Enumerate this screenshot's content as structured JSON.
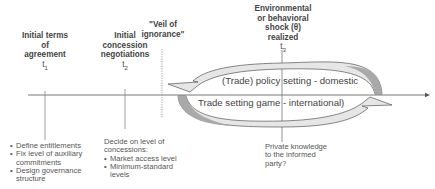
{
  "diagram": {
    "type": "timeline",
    "events": [
      {
        "id": "t1",
        "heading": [
          "Initial terms",
          "of",
          "agreement"
        ],
        "time_label": "t",
        "time_subscript": "1",
        "details": [
          "Define entitlements",
          "Fix level of auxiliary commitments",
          "Design governance structure"
        ]
      },
      {
        "id": "t2",
        "heading": [
          "Initial",
          "concession",
          "negotiations"
        ],
        "time_label": "t",
        "time_subscript": "2",
        "details_intro": "Decide on level of concessions:",
        "details": [
          "Market access level",
          "Minimum-standard levels"
        ]
      },
      {
        "id": "veil",
        "heading": [
          "\"Veil of",
          "ignorance\""
        ]
      },
      {
        "id": "t3",
        "heading": [
          "Environmental",
          "or behavioral",
          "shock (θ)",
          "realized"
        ],
        "time_label": "t",
        "time_subscript": "3",
        "details_intro": "Private knowledge to the informed party?"
      }
    ],
    "loop": {
      "top_label": "(Trade) policy setting - domestic",
      "bottom_label": "Trade setting game - international)"
    },
    "colors": {
      "line": "#555555",
      "arrow_dark": "#a9a9a9",
      "arrow_light": "#e6e6e6",
      "outline": "#555555"
    }
  }
}
